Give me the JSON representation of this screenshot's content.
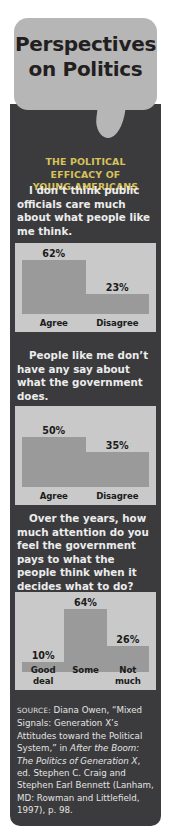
{
  "title": {
    "line1": "Perspectives",
    "line2": "on Politics"
  },
  "subtitle": {
    "line1": "THE POLITICAL EFFICACY OF",
    "line2": "YOUNG AMERICANS"
  },
  "questions": {
    "q1": "I don’t think public officials care much about what people like me think.",
    "q2": "People like me don’t have any say about what the government does.",
    "q3": "Over the years, how much attention do you feel the government pays to what the people think when it decides what to do?"
  },
  "source": {
    "label": "SOURCE:",
    "text_part1": " Diana Owen, “Mixed Signals: Generation X’s Attitudes toward the Political System,” in ",
    "italic1": "After the Boom: The Politics of Generation X",
    "text_part2": ", ed. Stephen C. Craig and Stephen Earl Bennett (Lanham, MD: Rowman and Littlefield, 1997), p. 98."
  },
  "colors": {
    "panel_dark": "#3b3b3d",
    "bubble_gray": "#b6b6b6",
    "chart_bg": "#c9c9c9",
    "bar_fill": "#9a9a9a",
    "subtitle_gold": "#d8c25a",
    "text_light": "#ececec"
  },
  "chart_data": [
    {
      "type": "bar",
      "title": "I don’t think public officials care much about what people like me think.",
      "categories": [
        "Agree",
        "Disagree"
      ],
      "values": [
        62,
        23
      ],
      "value_labels": [
        "62%",
        "23%"
      ],
      "xlabel": "",
      "ylabel": "",
      "ylim": [
        0,
        100
      ],
      "grid": false,
      "legend": "none"
    },
    {
      "type": "bar",
      "title": "People like me don’t have any say about what the government does.",
      "categories": [
        "Agree",
        "Disagree"
      ],
      "values": [
        50,
        35
      ],
      "value_labels": [
        "50%",
        "35%"
      ],
      "xlabel": "",
      "ylabel": "",
      "ylim": [
        0,
        100
      ],
      "grid": false,
      "legend": "none"
    },
    {
      "type": "bar",
      "title": "Over the years, how much attention do you feel the government pays to what the people think when it decides what to do?",
      "categories": [
        "Good deal",
        "Some",
        "Not much"
      ],
      "values": [
        10,
        64,
        26
      ],
      "value_labels": [
        "10%",
        "64%",
        "26%"
      ],
      "xlabel": "",
      "ylabel": "",
      "ylim": [
        0,
        100
      ],
      "grid": false,
      "legend": "none"
    }
  ]
}
